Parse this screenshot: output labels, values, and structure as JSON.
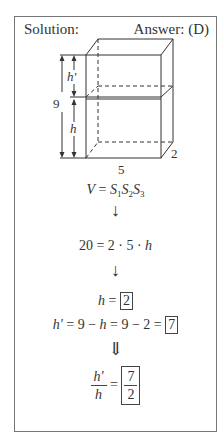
{
  "header": {
    "left": "Solution:",
    "right": "Answer: (D)"
  },
  "diagram": {
    "label_total_height": "9",
    "label_upper_height": "h'",
    "label_lower_height": "h",
    "label_width": "5",
    "label_depth": "2"
  },
  "steps": {
    "formula": {
      "lhs": "V",
      "eq": "=",
      "s1": "S",
      "s1_sub": "1",
      "s2": "S",
      "s2_sub": "2",
      "s3": "S",
      "s3_sub": "3"
    },
    "arrow1": "↓",
    "substituted": {
      "lhs": "20",
      "rhs": "= 2 · 5 · ",
      "var": "h"
    },
    "arrow2": "↓",
    "h_result": {
      "var": "h",
      "eq": " = ",
      "value": "2"
    },
    "hprime_result": {
      "var": "h'",
      "expr1": " = 9 − ",
      "var2": "h",
      "expr2": " = 9 − 2 = ",
      "value": "7"
    },
    "arrow3": "⇓",
    "ratio": {
      "num_var": "h'",
      "den_var": "h",
      "eq": " = ",
      "value_num": "7",
      "value_den": "2"
    }
  },
  "colors": {
    "stroke": "#333333",
    "frame": "#777777"
  }
}
